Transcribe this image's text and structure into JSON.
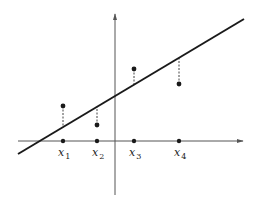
{
  "diagram": {
    "colors": {
      "axis": "#555555",
      "line": "#1a1a1a",
      "point": "#1a1a1a",
      "residual": "#444444",
      "text": "#222222"
    },
    "axes": {
      "x_axis": {
        "y": 141,
        "x_start": 18,
        "x_end": 243
      },
      "y_axis": {
        "x": 115,
        "y_start": 195,
        "y_end": 14
      }
    },
    "regression_line": {
      "x1": 18,
      "y1": 154,
      "x2": 244,
      "y2": 19
    },
    "x_ticks": [
      {
        "label_base": "x",
        "label_sub": "1",
        "x": 63
      },
      {
        "label_base": "x",
        "label_sub": "2",
        "x": 97
      },
      {
        "label_base": "x",
        "label_sub": "3",
        "x": 134
      },
      {
        "label_base": "x",
        "label_sub": "4",
        "x": 179
      }
    ],
    "data_points": [
      {
        "x": 63,
        "y": 106,
        "line_y": 127
      },
      {
        "x": 97,
        "y": 125,
        "line_y": 107
      },
      {
        "x": 134,
        "y": 69,
        "line_y": 85
      },
      {
        "x": 179,
        "y": 84,
        "line_y": 58
      }
    ]
  }
}
